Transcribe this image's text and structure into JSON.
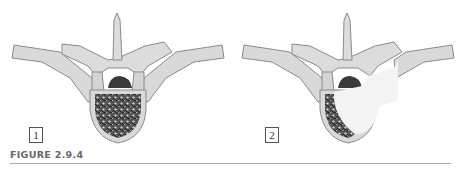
{
  "figure": {
    "caption": "FIGURE 2.9.4",
    "panels": [
      {
        "label": "1",
        "description": "Vertebra with vertebral body fully filled by trabecular/lytic pattern"
      },
      {
        "label": "2",
        "description": "Vertebra with lesion replacing most of the vertebral body, extending into pedicle and transverse process"
      }
    ]
  },
  "colors": {
    "bone": "#d9d9d9",
    "bone_outline": "#8a8a8a",
    "canal_dark": "#3a3a3a",
    "trabecular": "#2a2a2a",
    "lesion": "#f4f4f4",
    "caption": "#666666",
    "rule": "#aaaaaa"
  }
}
